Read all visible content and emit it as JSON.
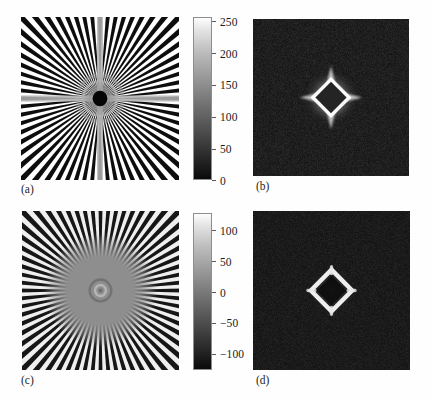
{
  "figure": {
    "background": "#fefefe",
    "layout": "2x2 grid of image panels with two shared vertical grayscale colorbars"
  },
  "panels": [
    {
      "id": "a",
      "caption": "(a)",
      "kind": "image",
      "description": "radial starburst / zone-plate test pattern with central black disc",
      "colormap": "gray",
      "value_range": [
        0,
        255
      ]
    },
    {
      "id": "b",
      "caption": "(b)",
      "kind": "image",
      "description": "Fourier magnitude spectrum, dark field with bright filled diamond at centre",
      "colormap": "gray"
    },
    {
      "id": "c",
      "caption": "(c)",
      "kind": "image",
      "description": "high-pass filtered starburst pattern, flat grey centre region",
      "colormap": "gray",
      "value_range": [
        -128,
        127
      ]
    },
    {
      "id": "d",
      "caption": "(d)",
      "kind": "image",
      "description": "Fourier magnitude spectrum, dark field with bright hollow diamond ring at centre",
      "colormap": "gray"
    }
  ],
  "colorbars": [
    {
      "id": "colorbar-top",
      "for_panel": "a",
      "orientation": "vertical",
      "min": 0,
      "max": 255,
      "ticks": [
        {
          "value": 250,
          "label": "250"
        },
        {
          "value": 200,
          "label": "200"
        },
        {
          "value": 150,
          "label": "150"
        },
        {
          "value": 100,
          "label": "100"
        },
        {
          "value": 50,
          "label": "50"
        },
        {
          "value": 0,
          "label": "0"
        }
      ]
    },
    {
      "id": "colorbar-bottom",
      "for_panel": "c",
      "orientation": "vertical",
      "min": -128,
      "max": 127,
      "ticks": [
        {
          "value": 100,
          "label": "100"
        },
        {
          "value": 50,
          "label": "50"
        },
        {
          "value": 0,
          "label": "0"
        },
        {
          "value": -50,
          "label": "−50"
        },
        {
          "value": -100,
          "label": "−100"
        }
      ]
    }
  ],
  "chart_data": {
    "type": "heatmap",
    "title": "",
    "subtitle": "",
    "panel_count": 4,
    "panels": [
      {
        "id": "a",
        "label": "(a)",
        "type": "heatmap",
        "content": "radial spoke (starburst) test pattern, 64 spokes, black disc at centre",
        "colormap": "gray",
        "zlim": [
          0,
          255
        ],
        "colorbar_ticks": [
          0,
          50,
          100,
          150,
          200,
          250
        ]
      },
      {
        "id": "b",
        "label": "(b)",
        "type": "heatmap",
        "content": "log magnitude spectrum of (a): dark background, bright filled diamond lobe at origin with four radial spikes",
        "colormap": "gray",
        "colorbar_ticks": []
      },
      {
        "id": "c",
        "label": "(c)",
        "type": "heatmap",
        "content": "high-pass filtered starburst: outer spokes retained, interior flattened to mid-grey, faint ring at centre",
        "colormap": "gray",
        "zlim": [
          -128,
          127
        ],
        "colorbar_ticks": [
          -100,
          -50,
          0,
          50,
          100
        ]
      },
      {
        "id": "d",
        "label": "(d)",
        "type": "heatmap",
        "content": "log magnitude spectrum of (c): dark background, bright hollow diamond ring at origin",
        "colormap": "gray",
        "colorbar_ticks": []
      }
    ],
    "legend_position": "right-of-panel",
    "grid": false
  }
}
